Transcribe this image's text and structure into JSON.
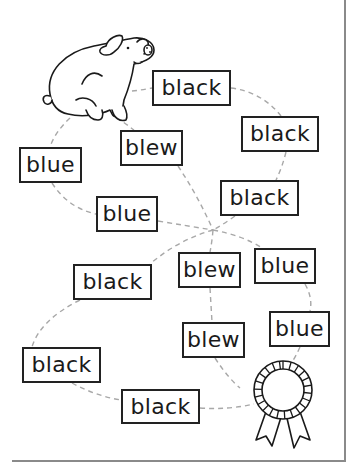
{
  "maze": {
    "start_icon": "pig-icon",
    "end_icon": "award-ribbon-icon",
    "words": [
      {
        "label": "black",
        "x": 152,
        "y": 70,
        "w": 79,
        "h": 36
      },
      {
        "label": "black",
        "x": 241,
        "y": 116,
        "w": 78,
        "h": 36
      },
      {
        "label": "blew",
        "x": 120,
        "y": 130,
        "w": 63,
        "h": 36
      },
      {
        "label": "blue",
        "x": 19,
        "y": 147,
        "w": 63,
        "h": 36
      },
      {
        "label": "black",
        "x": 220,
        "y": 180,
        "w": 79,
        "h": 36
      },
      {
        "label": "blue",
        "x": 96,
        "y": 196,
        "w": 62,
        "h": 36
      },
      {
        "label": "black",
        "x": 73,
        "y": 264,
        "w": 79,
        "h": 36
      },
      {
        "label": "blew",
        "x": 178,
        "y": 252,
        "w": 63,
        "h": 36
      },
      {
        "label": "blue",
        "x": 254,
        "y": 248,
        "w": 62,
        "h": 36
      },
      {
        "label": "blew",
        "x": 182,
        "y": 322,
        "w": 63,
        "h": 36
      },
      {
        "label": "blue",
        "x": 269,
        "y": 311,
        "w": 61,
        "h": 36
      },
      {
        "label": "black",
        "x": 22,
        "y": 347,
        "w": 79,
        "h": 36
      },
      {
        "label": "black",
        "x": 121,
        "y": 389,
        "w": 79,
        "h": 35
      }
    ]
  },
  "colors": {
    "box_border": "#222222",
    "path_dash": "#a0a0a0",
    "frame": "#8a8a8a"
  }
}
